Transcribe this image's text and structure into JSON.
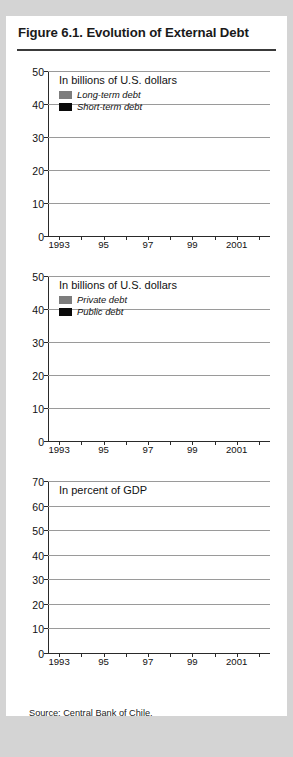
{
  "figure": {
    "title": "Figure 6.1. Evolution of External Debt",
    "source": "Source: Central Bank of Chile."
  },
  "colors": {
    "gray_series": "#7d7d7d",
    "black_series": "#0a0a0a",
    "solid_series": "#6e6e6e",
    "gridline": "#9a9a9a",
    "axis": "#2a2a2a",
    "card_background": "#ffffff",
    "page_background": "#d4d4d4"
  },
  "chart_data": [
    {
      "type": "bar",
      "stacked": true,
      "title": "In billions of U.S. dollars",
      "xlabel": "",
      "ylabel": "",
      "ylim": [
        0,
        50
      ],
      "yticks": [
        0,
        10,
        20,
        30,
        40,
        50
      ],
      "grid": true,
      "legend_position": "top-left",
      "categories": [
        "1993",
        "94",
        "95",
        "96",
        "97",
        "98",
        "99",
        "2000",
        "2001",
        "2002"
      ],
      "tick_labels": [
        {
          "index": 0,
          "label": "1993"
        },
        {
          "index": 2,
          "label": "95"
        },
        {
          "index": 4,
          "label": "97"
        },
        {
          "index": 6,
          "label": "99"
        },
        {
          "index": 8,
          "label": "2001"
        }
      ],
      "series": [
        {
          "name": "Short-term debt",
          "color": "#0a0a0a",
          "values": [
            3.4,
            3.9,
            3.5,
            7.2,
            5.6,
            5.2,
            4.5,
            6.3,
            5.5,
            6.0
          ]
        },
        {
          "name": "Long-term debt",
          "color": "#7d7d7d",
          "values": [
            15.9,
            17.5,
            18.3,
            19.1,
            23.5,
            27.5,
            30.5,
            31.0,
            33.2,
            35.1
          ]
        }
      ],
      "totals": [
        19.3,
        21.4,
        21.8,
        26.3,
        29.1,
        32.7,
        35.0,
        37.3,
        38.7,
        41.1
      ]
    },
    {
      "type": "bar",
      "stacked": true,
      "title": "In billions of U.S. dollars",
      "xlabel": "",
      "ylabel": "",
      "ylim": [
        0,
        50
      ],
      "yticks": [
        0,
        10,
        20,
        30,
        40,
        50
      ],
      "grid": true,
      "legend_position": "top-left",
      "categories": [
        "1993",
        "94",
        "95",
        "96",
        "97",
        "98",
        "99",
        "2000",
        "2001",
        "2002"
      ],
      "tick_labels": [
        {
          "index": 0,
          "label": "1993"
        },
        {
          "index": 2,
          "label": "95"
        },
        {
          "index": 4,
          "label": "97"
        },
        {
          "index": 6,
          "label": "99"
        },
        {
          "index": 8,
          "label": "2001"
        }
      ],
      "series": [
        {
          "name": "Public debt",
          "color": "#0a0a0a",
          "values": [
            9.2,
            9.3,
            7.5,
            6.0,
            5.5,
            5.9,
            6.0,
            6.0,
            6.2,
            7.5
          ]
        },
        {
          "name": "Private debt",
          "color": "#7d7d7d",
          "values": [
            10.1,
            12.1,
            14.3,
            20.3,
            23.6,
            26.8,
            29.0,
            31.3,
            32.5,
            33.6
          ]
        }
      ],
      "totals": [
        19.3,
        21.4,
        21.8,
        26.3,
        29.1,
        32.7,
        35.0,
        37.3,
        38.7,
        41.1
      ]
    },
    {
      "type": "bar",
      "stacked": false,
      "title": "In percent of GDP",
      "xlabel": "",
      "ylabel": "",
      "ylim": [
        0,
        70
      ],
      "yticks": [
        0,
        10,
        20,
        30,
        40,
        50,
        60,
        70
      ],
      "grid": true,
      "legend_position": "none",
      "categories": [
        "1993",
        "94",
        "95",
        "96",
        "97",
        "98",
        "99",
        "2000",
        "2001",
        "2002"
      ],
      "tick_labels": [
        {
          "index": 0,
          "label": "1993"
        },
        {
          "index": 2,
          "label": "95"
        },
        {
          "index": 4,
          "label": "97"
        },
        {
          "index": 6,
          "label": "99"
        },
        {
          "index": 8,
          "label": "2001"
        }
      ],
      "series": [
        {
          "name": "External debt in percent of GDP",
          "color": "#6e6e6e",
          "values": [
            43.2,
            42.3,
            33.4,
            38.4,
            38.7,
            44.9,
            51.7,
            50.1,
            56.7,
            62.0
          ]
        }
      ]
    }
  ]
}
